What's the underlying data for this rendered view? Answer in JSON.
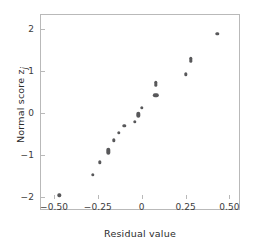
{
  "chart_data": {
    "type": "scatter",
    "title": "",
    "xlabel": "Residual value",
    "ylabel": "Normal score z",
    "ylabel_subscript": "j",
    "xlim": [
      -0.58,
      0.56
    ],
    "ylim": [
      -2.32,
      2.37
    ],
    "xticks": [
      -0.5,
      -0.25,
      0,
      0.25,
      0.5
    ],
    "xticklabels": [
      "−0.50",
      "−0.25",
      "0",
      "0.25",
      "0.50"
    ],
    "yticks": [
      -2,
      -1,
      0,
      1,
      2
    ],
    "yticklabels": [
      "−2",
      "−1",
      "0",
      "1",
      "2"
    ],
    "grid": false,
    "legend": false,
    "marker_color": "#58585a",
    "axis_color": "#b9b9b9",
    "background": "#ffffff",
    "points": [
      {
        "x": -0.47,
        "y": -1.97,
        "shape": "round"
      },
      {
        "x": -0.28,
        "y": -1.48,
        "shape": "round"
      },
      {
        "x": -0.24,
        "y": -1.18,
        "shape": "round"
      },
      {
        "x": -0.19,
        "y": -0.92,
        "shape": "tall"
      },
      {
        "x": -0.16,
        "y": -0.65,
        "shape": "round"
      },
      {
        "x": -0.13,
        "y": -0.48,
        "shape": "round"
      },
      {
        "x": -0.1,
        "y": -0.31,
        "shape": "round"
      },
      {
        "x": -0.04,
        "y": -0.21,
        "shape": "round"
      },
      {
        "x": -0.02,
        "y": -0.04,
        "shape": "tall"
      },
      {
        "x": 0.0,
        "y": 0.13,
        "shape": "round"
      },
      {
        "x": 0.08,
        "y": 0.42,
        "shape": "wide"
      },
      {
        "x": 0.08,
        "y": 0.7,
        "shape": "tall"
      },
      {
        "x": 0.25,
        "y": 0.93,
        "shape": "round"
      },
      {
        "x": 0.28,
        "y": 1.27,
        "shape": "tall"
      },
      {
        "x": 0.43,
        "y": 1.89,
        "shape": "round"
      }
    ]
  }
}
